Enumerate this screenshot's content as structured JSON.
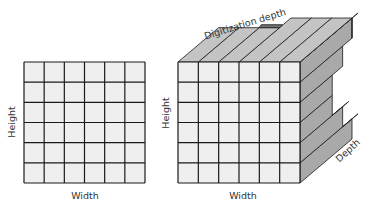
{
  "figure": {
    "left_panel": {
      "title": "2D image grid",
      "rows": 6,
      "cols": 6,
      "x_label": "Width",
      "y_label": "Height",
      "bounds": {
        "x": 24,
        "y": 62,
        "w": 121,
        "h": 121
      }
    },
    "right_panel": {
      "title": "3D digitized volume",
      "rows": 6,
      "cols": 6,
      "x_label": "Width",
      "y_label": "Height",
      "depth_label": "Depth",
      "top_label": "Digitization depth",
      "front_bounds": {
        "x": 178,
        "y": 62,
        "w": 122,
        "h": 121
      },
      "depth_offset": {
        "dx": 52,
        "dy": -44
      },
      "row_depths": [
        1.0,
        0.82,
        0.62,
        0.62,
        0.82,
        1.0
      ],
      "top_col_depths": [
        0.78,
        0.78,
        0.78,
        1.0,
        1.0,
        1.0
      ]
    },
    "colors": {
      "cell_fill": "#efefef",
      "grid_line": "#1a1a1a",
      "side_face": "#a9a9a9",
      "top_face": "#c4c4c4",
      "shadow_face": "#707070",
      "label_text": "#333333"
    }
  }
}
